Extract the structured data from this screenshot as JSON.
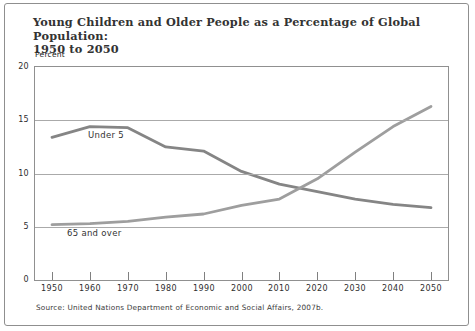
{
  "figure": {
    "title": "Young Children and Older People as a Percentage of Global Population:\n1950 to 2050",
    "y_axis_unit_label": "Percent",
    "source": "Source: United Nations Department of Economic and Social Affairs, 2007b."
  },
  "chart_data": {
    "type": "line",
    "title": "Young Children and Older People as a Percentage of Global Population: 1950 to 2050",
    "xlabel": "",
    "ylabel": "Percent",
    "x": [
      1950,
      1960,
      1970,
      1980,
      1990,
      2000,
      2010,
      2020,
      2030,
      2040,
      2050
    ],
    "series": [
      {
        "name": "Under 5",
        "color": "#858585",
        "values": [
          13.4,
          14.4,
          14.3,
          12.5,
          12.1,
          10.2,
          9.0,
          8.3,
          7.6,
          7.1,
          6.8
        ]
      },
      {
        "name": "65 and over",
        "color": "#9e9e9e",
        "values": [
          5.2,
          5.3,
          5.5,
          5.9,
          6.2,
          7.0,
          7.6,
          9.5,
          12.0,
          14.4,
          16.3
        ]
      }
    ],
    "ylim": [
      0,
      20
    ],
    "y_ticks": [
      20,
      15,
      10,
      5,
      0
    ],
    "gridlines": [
      15,
      10,
      5
    ],
    "grid": "horizontal",
    "legend_position": "inline-labels",
    "source": "Source: United Nations Department of Economic and Social Affairs, 2007b."
  }
}
